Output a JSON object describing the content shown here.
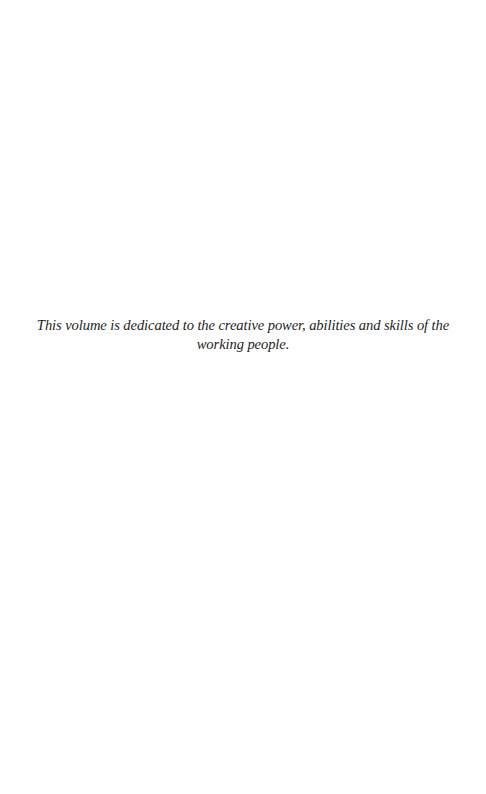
{
  "page": {
    "background": "#ffffff",
    "text_color": "#1e1e1e"
  },
  "dedication": {
    "lines": [
      "This volume is dedicated to the creative power, abilities and skills of the",
      "working people."
    ]
  }
}
